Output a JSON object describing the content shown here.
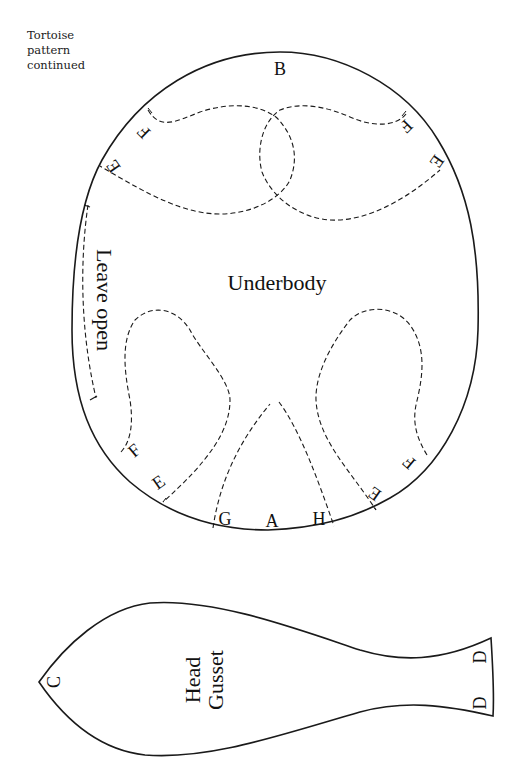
{
  "caption": {
    "line1": "Tortoise",
    "line2": "pattern",
    "line3": "continued"
  },
  "underbody": {
    "title": "Underbody",
    "note": "Leave open",
    "markers": {
      "top": "B",
      "upper_left_f": "F",
      "upper_left_e": "E",
      "upper_right_f": "F",
      "upper_right_e": "E",
      "lower_left_f": "F",
      "lower_left_e": "E",
      "lower_right_f": "F",
      "lower_right_e": "E",
      "bottom_g": "G",
      "bottom_a": "A",
      "bottom_h": "H"
    }
  },
  "head_gusset": {
    "title_line1": "Head",
    "title_line2": "Gusset",
    "markers": {
      "point": "C",
      "end_top": "D",
      "end_bottom": "D"
    }
  }
}
